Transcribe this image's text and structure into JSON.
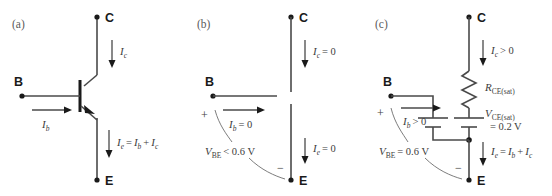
{
  "figure": {
    "background": "#ffffff",
    "wire_color": "#4a4a4a",
    "text_color": "#3c3c3c",
    "node_color": "#1a1a1a",
    "width": 552,
    "height": 196
  },
  "panels": [
    {
      "tag": "(a)",
      "name": "active-mode-transistor",
      "terminals": {
        "collector": "C",
        "base": "B",
        "emitter": "E"
      },
      "labels": {
        "ic": "I",
        "ic_sub": "c",
        "ib": "I",
        "ib_sub": "b",
        "ie": "I",
        "ie_sub": "e",
        "ie_eq": "=",
        "ie_rhs1": "I",
        "ie_rhs1_sub": "b",
        "ie_plus": "+",
        "ie_rhs2": "I",
        "ie_rhs2_sub": "c"
      }
    },
    {
      "tag": "(b)",
      "name": "cutoff-mode-model",
      "terminals": {
        "collector": "C",
        "base": "B",
        "emitter": "E"
      },
      "labels": {
        "ic": "I",
        "ic_sub": "c",
        "ic_val": "= 0",
        "ib": "I",
        "ib_sub": "b",
        "ib_val": "= 0",
        "ie": "I",
        "ie_sub": "e",
        "ie_val": "= 0",
        "vbe": "V",
        "vbe_sub": "BE",
        "vbe_val": "< 0.6 V",
        "plus": "+",
        "minus": "−"
      }
    },
    {
      "tag": "(c)",
      "name": "saturation-mode-model",
      "terminals": {
        "collector": "C",
        "base": "B",
        "emitter": "E"
      },
      "labels": {
        "ic": "I",
        "ic_sub": "c",
        "ic_val": "> 0",
        "ib": "I",
        "ib_sub": "b",
        "ib_val": "> 0",
        "ie": "I",
        "ie_sub": "e",
        "ie_eq": "=",
        "ie_rhs1": "I",
        "ie_rhs1_sub": "b",
        "ie_plus": "+",
        "ie_rhs2": "I",
        "ie_rhs2_sub": "c",
        "rce": "R",
        "rce_sub": "CE(sat)",
        "vce": "V",
        "vce_sub": "CE(sat)",
        "vce_val": "= 0.2 V",
        "vbe": "V",
        "vbe_sub": "BE",
        "vbe_val": "= 0.6 V",
        "plus": "+",
        "minus": "−"
      }
    }
  ]
}
